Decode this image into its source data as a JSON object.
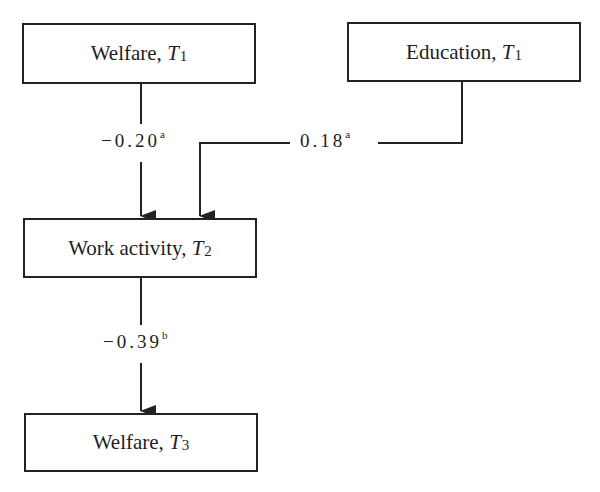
{
  "diagram": {
    "type": "path-diagram",
    "nodes": [
      {
        "id": "welfare_t1",
        "label": "Welfare, ",
        "var": "T",
        "sub": "1"
      },
      {
        "id": "education_t1",
        "label": "Education, ",
        "var": "T",
        "sub": "1"
      },
      {
        "id": "work_activity_t2",
        "label": "Work activity, ",
        "var": "T",
        "sub": "2"
      },
      {
        "id": "welfare_t3",
        "label": "Welfare, ",
        "var": "T",
        "sub": "3"
      }
    ],
    "edges": [
      {
        "from": "welfare_t1",
        "to": "work_activity_t2",
        "coefficient": "−0.20",
        "note": "a"
      },
      {
        "from": "education_t1",
        "to": "work_activity_t2",
        "coefficient": "0.18",
        "note": "a"
      },
      {
        "from": "work_activity_t2",
        "to": "welfare_t3",
        "coefficient": "−0.39",
        "note": "b"
      }
    ],
    "colors": {
      "line": "#222222",
      "text": "#1e1e1e",
      "background": "#ffffff"
    }
  }
}
